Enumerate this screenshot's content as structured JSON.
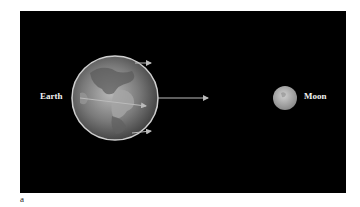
{
  "figure": {
    "panel_label": "a",
    "labels": {
      "earth": "Earth",
      "moon": "Moon"
    },
    "background_color": "#000000",
    "arrow_color": "#bbbbbb",
    "elements": [
      {
        "name": "earth",
        "shape": "globe",
        "description": "Earth shown with continents"
      },
      {
        "name": "moon",
        "shape": "sphere"
      },
      {
        "name": "arrow-top",
        "direction": "right",
        "position": "top of Earth"
      },
      {
        "name": "arrow-center",
        "direction": "right",
        "position": "center of Earth"
      },
      {
        "name": "arrow-bottom",
        "direction": "right",
        "position": "bottom of Earth"
      },
      {
        "name": "arrow-long",
        "direction": "right",
        "position": "from Earth toward Moon"
      }
    ]
  }
}
